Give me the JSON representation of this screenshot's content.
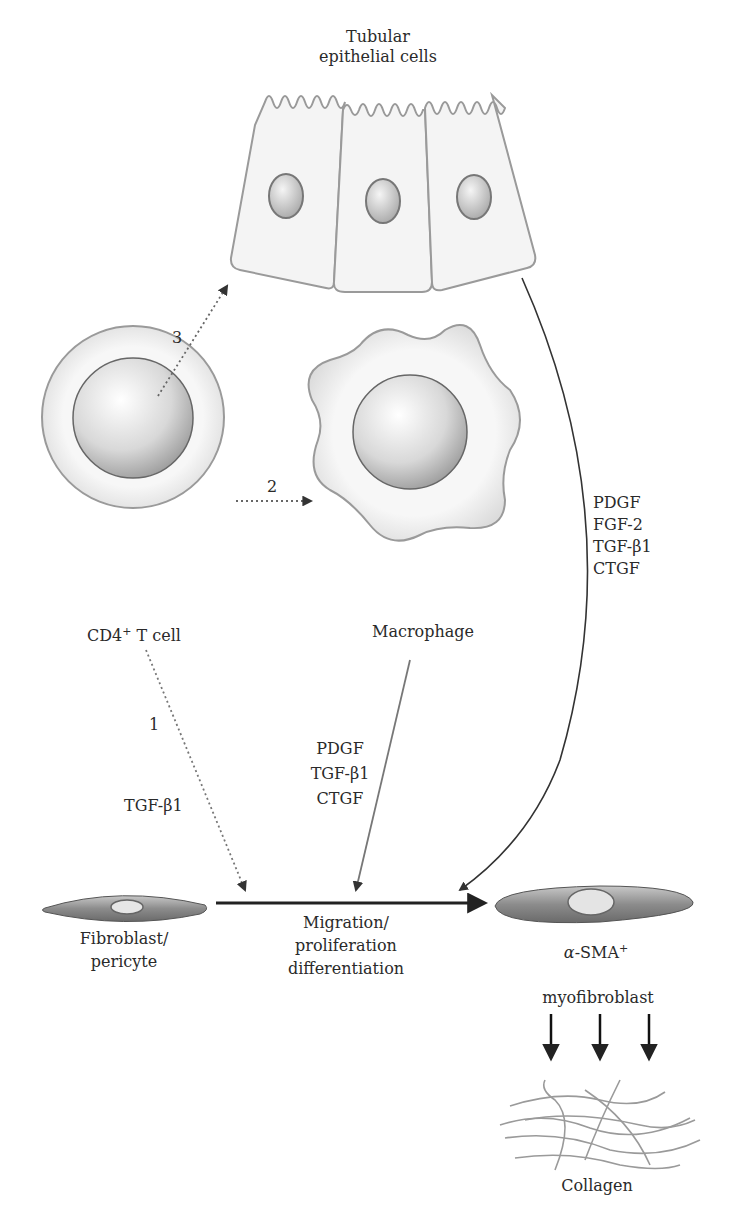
{
  "cells": {
    "epithelial": {
      "label_line1": "Tubular",
      "label_line2": "epithelial cells"
    },
    "tcell": {
      "label": "CD4",
      "label_sup": "+",
      "label_rest": " T cell"
    },
    "macrophage": {
      "label": "Macrophage"
    },
    "fibroblast": {
      "label_line1": "Fibroblast/",
      "label_line2": "pericyte"
    },
    "myofibroblast": {
      "label_prefix": "α",
      "label_main": "-SMA",
      "label_sup": "+",
      "label_line2": "myofibroblast"
    },
    "collagen": {
      "label": "Collagen"
    }
  },
  "pathways": {
    "path1": {
      "number": "1",
      "factor": "TGF-β1"
    },
    "path2": {
      "number": "2"
    },
    "path3": {
      "number": "3"
    },
    "macrophage_factors": [
      "PDGF",
      "TGF-β1",
      "CTGF"
    ],
    "epithelial_factors": [
      "PDGF",
      "FGF-2",
      "TGF-β1",
      "CTGF"
    ]
  },
  "process": {
    "line1": "Migration/",
    "line2": "proliferation",
    "line3": "differentiation"
  },
  "colors": {
    "outline": "#8a8a8a",
    "fill": "#f2f2f2",
    "arrow": "#222222",
    "dotted_arrow": "#666666",
    "text": "#2a2a2a"
  }
}
